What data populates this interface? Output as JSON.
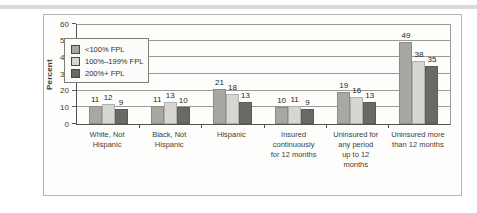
{
  "figure": {
    "kind": "scanned report bar chart",
    "background_color": "#fdfdfb",
    "border_color": "#b5b4af"
  },
  "chart_data": {
    "type": "bar",
    "title": "",
    "xlabel": "",
    "ylabel": "Percent",
    "ylim": [
      0,
      60
    ],
    "yticks": [
      0,
      10,
      20,
      30,
      40,
      50,
      60
    ],
    "grid": true,
    "legend_position": "top-left",
    "categories": [
      "White, Not\nHispanic",
      "Black, Not\nHispanic",
      "Hispanic",
      "Insured\ncontinuously\nfor 12 months",
      "Uninsured for\nany period\nup to 12\nmonths",
      "Uninsured more\nthan 12 months"
    ],
    "series": [
      {
        "name": "<100% FPL",
        "color": "#a9a7a4",
        "values": [
          11,
          11,
          21,
          10,
          19,
          49
        ]
      },
      {
        "name": "100%–199% FPL",
        "color": "#d8d6d2",
        "values": [
          12,
          13,
          18,
          11,
          16,
          38
        ]
      },
      {
        "name": "200%+ FPL",
        "color": "#6b6966",
        "values": [
          9,
          10,
          13,
          9,
          13,
          35
        ]
      }
    ]
  }
}
